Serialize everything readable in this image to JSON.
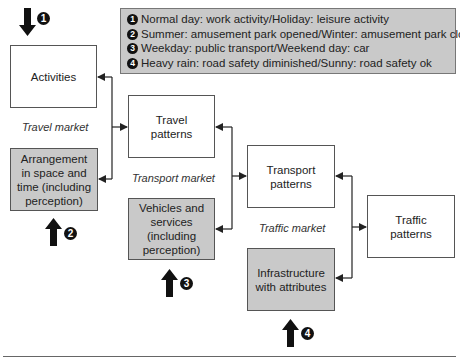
{
  "legend": {
    "items": [
      {
        "num": "1",
        "text": "Normal day: work activity/Holiday: leisure activity"
      },
      {
        "num": "2",
        "text": "Summer: amusement park opened/Winter: amusement park closed"
      },
      {
        "num": "3",
        "text": "Weekday: public transport/Weekend day: car"
      },
      {
        "num": "4",
        "text": "Heavy rain: road safety diminished/Sunny: road safety ok"
      }
    ]
  },
  "boxes": {
    "activities": "Activities",
    "arrangement": "Arrangement in space and time (including perception)",
    "travel_patterns": "Travel patterns",
    "vehicles": "Vehicles and services (including perception)",
    "transport_patterns": "Transport patterns",
    "infrastructure": "Infrastructure with attributes",
    "traffic_patterns": "Traffic patterns"
  },
  "markets": {
    "travel": "Travel market",
    "transport": "Transport market",
    "traffic": "Traffic market"
  },
  "influences": {
    "i1": "1",
    "i2": "2",
    "i3": "3",
    "i4": "4"
  },
  "colors": {
    "gray_box": "#c9c9c9",
    "line": "#222222"
  }
}
